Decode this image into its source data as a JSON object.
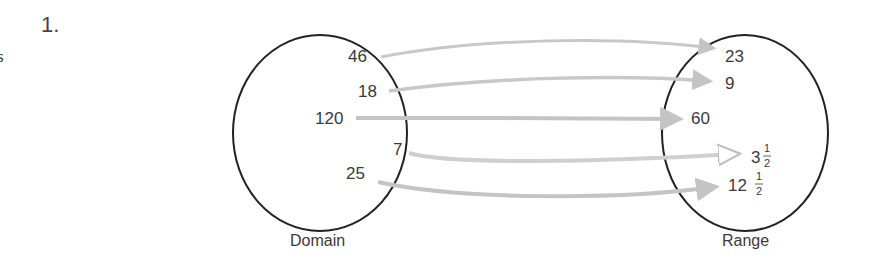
{
  "problem": {
    "number": "1.",
    "cropped_margin_text": "s"
  },
  "diagram": {
    "type": "mapping",
    "domain": {
      "caption": "Domain",
      "values": [
        "46",
        "18",
        "120",
        "7",
        "25"
      ]
    },
    "range": {
      "caption": "Range",
      "values": [
        {
          "whole": "23"
        },
        {
          "whole": "9"
        },
        {
          "whole": "60"
        },
        {
          "whole": "3",
          "num": "1",
          "den": "2"
        },
        {
          "whole": "12",
          "num": "1",
          "den": "2"
        }
      ]
    },
    "mappings": [
      {
        "from": "46",
        "to": "23"
      },
      {
        "from": "18",
        "to": "9"
      },
      {
        "from": "120",
        "to": "60"
      },
      {
        "from": "7",
        "to": "3 1/2"
      },
      {
        "from": "25",
        "to": "12 1/2"
      }
    ],
    "colors": {
      "circle": "#222222",
      "arrow": "#c4c4c4",
      "arrow_outline": "#b5b5b5",
      "text": "#3a3a3a"
    }
  }
}
